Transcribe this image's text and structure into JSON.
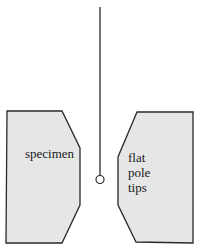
{
  "diagram": {
    "labels": {
      "specimen": "specimen",
      "pole_tips": [
        "flat",
        "pole",
        "tips"
      ]
    },
    "colors": {
      "fill": "#e6e6e6",
      "stroke": "#2a2a2a",
      "background": "#ffffff"
    },
    "elements": [
      {
        "id": "suspension-wire",
        "type": "line"
      },
      {
        "id": "probe-sphere",
        "type": "circle"
      },
      {
        "id": "left-block",
        "type": "polygon",
        "label": "specimen"
      },
      {
        "id": "right-block",
        "type": "polygon",
        "label": "flat pole tips"
      }
    ]
  }
}
